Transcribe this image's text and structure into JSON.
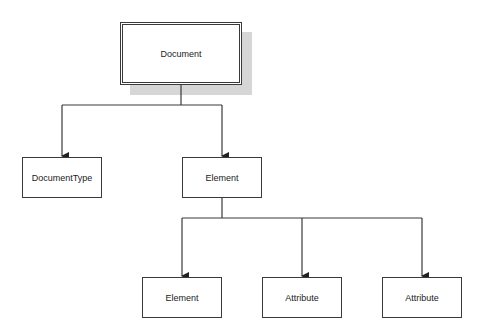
{
  "diagram": {
    "type": "tree",
    "colors": {
      "stroke": "#3a3a3a",
      "shadow": "#d6d6d6",
      "background": "#ffffff"
    },
    "nodes": [
      {
        "id": "document",
        "label": "Document",
        "x": 120,
        "y": 22,
        "w": 122,
        "h": 63,
        "root": true
      },
      {
        "id": "doctype",
        "label": "DocumentType",
        "x": 22,
        "y": 157,
        "w": 80,
        "h": 41
      },
      {
        "id": "element",
        "label": "Element",
        "x": 182,
        "y": 157,
        "w": 80,
        "h": 41
      },
      {
        "id": "child-element",
        "label": "Element",
        "x": 142,
        "y": 277,
        "w": 80,
        "h": 41
      },
      {
        "id": "attribute-1",
        "label": "Attribute",
        "x": 262,
        "y": 277,
        "w": 80,
        "h": 41
      },
      {
        "id": "attribute-2",
        "label": "Attribute",
        "x": 382,
        "y": 277,
        "w": 80,
        "h": 41
      }
    ],
    "edges": [
      {
        "from": "document",
        "to": "doctype"
      },
      {
        "from": "document",
        "to": "element"
      },
      {
        "from": "element",
        "to": "child-element"
      },
      {
        "from": "element",
        "to": "attribute-1"
      },
      {
        "from": "element",
        "to": "attribute-2"
      }
    ]
  }
}
